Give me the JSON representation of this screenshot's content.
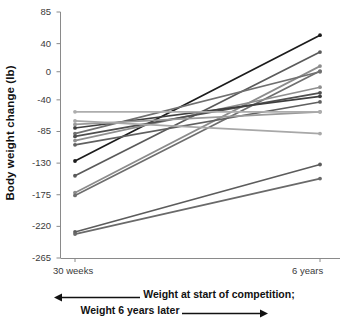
{
  "chart_data": {
    "type": "line",
    "title": "",
    "subtitle": "",
    "xlabel": "Weight at start of competition; Weight 6 years later",
    "ylabel": "Body weight change (lb)",
    "categories": [
      "30 weeks",
      "6 years"
    ],
    "x_tick_labels": [
      "30 weeks",
      "6 years"
    ],
    "y_tick_labels": [
      "85",
      "40",
      "0",
      "-40",
      "-85",
      "-130",
      "-175",
      "-220",
      "-265"
    ],
    "y_ticks": [
      85,
      40,
      0,
      -40,
      -85,
      -130,
      -175,
      -220,
      -265
    ],
    "ylim": [
      -265,
      85
    ],
    "grid": false,
    "legend": false,
    "legend_position": "none",
    "markers": "filled-circle-both-ends",
    "n_series": 14,
    "series": [
      {
        "name": "participant-1",
        "color": "#1c1c1c",
        "values": [
          -127,
          52
        ]
      },
      {
        "name": "participant-2",
        "color": "#5a5a5a",
        "values": [
          -148,
          28
        ]
      },
      {
        "name": "participant-3",
        "color": "#8c8c8c",
        "values": [
          -172,
          8
        ]
      },
      {
        "name": "participant-4",
        "color": "#6e6e6e",
        "values": [
          -176,
          1
        ]
      },
      {
        "name": "participant-5",
        "color": "#707070",
        "values": [
          -88,
          0
        ]
      },
      {
        "name": "participant-6",
        "color": "#8f8f8f",
        "values": [
          -98,
          -22
        ]
      },
      {
        "name": "participant-7",
        "color": "#4f4f4f",
        "values": [
          -92,
          -30
        ]
      },
      {
        "name": "participant-8",
        "color": "#3f3f3f",
        "values": [
          -80,
          -35
        ]
      },
      {
        "name": "participant-9",
        "color": "#606060",
        "values": [
          -104,
          -43
        ]
      },
      {
        "name": "participant-10",
        "color": "#9a9a9a",
        "values": [
          -75,
          -57
        ]
      },
      {
        "name": "participant-11",
        "color": "#adadad",
        "values": [
          -57,
          -57
        ]
      },
      {
        "name": "participant-12",
        "color": "#a8a8a8",
        "values": [
          -70,
          -88
        ]
      },
      {
        "name": "participant-13",
        "color": "#5c5c5c",
        "values": [
          -228,
          -132
        ]
      },
      {
        "name": "participant-14",
        "color": "#6a6a6a",
        "values": [
          -231,
          -152
        ]
      }
    ]
  },
  "axis": {
    "y_title": "Body weight change (lb)",
    "x_left_label": "30 weeks",
    "x_right_label": "6 years"
  },
  "caption": {
    "line1": "Weight at start of competition;",
    "line2": "Weight 6 years later",
    "left_arrow_icon": "left-arrow-icon",
    "right_arrow_icon": "right-arrow-icon"
  },
  "colors": {
    "axis": "#8a8a8a",
    "tick_text": "#3a3a3a",
    "title_text": "#111111",
    "background": "#ffffff"
  }
}
